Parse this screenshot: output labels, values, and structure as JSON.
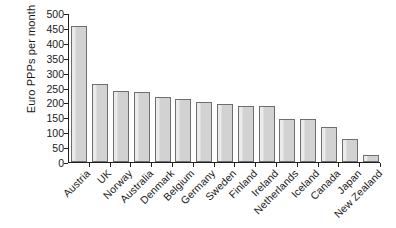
{
  "chart_data": {
    "type": "bar",
    "title": "",
    "subtitle": "",
    "xlabel": "",
    "ylabel": "Euro PPPs per month",
    "ylim": [
      0,
      500
    ],
    "ytick_step": 50,
    "yticks": [
      "500",
      "450",
      "400",
      "350",
      "300",
      "250",
      "200",
      "150",
      "100",
      "50",
      "0"
    ],
    "grid": false,
    "legend": "none",
    "axis_style": "left-and-bottom-spines",
    "xtick_label_rotation": -45,
    "categories": [
      "Austria",
      "UK",
      "Norway",
      "Australia",
      "Denmark",
      "Belgium",
      "Germany",
      "Sweden",
      "Finland",
      "Ireland",
      "Netherlands",
      "Iceland",
      "Canada",
      "Japan",
      "New Zealand"
    ],
    "values": [
      455,
      263,
      238,
      235,
      219,
      213,
      203,
      194,
      187,
      188,
      145,
      143,
      119,
      78,
      22
    ],
    "series": [
      {
        "name": "Euro PPPs per month",
        "values": [
          455,
          263,
          238,
          235,
          219,
          213,
          203,
          194,
          187,
          188,
          145,
          143,
          119,
          78,
          22
        ]
      }
    ],
    "colors": {
      "bar_fill": "#d2d2d2",
      "bar_border": "#6e6e6e",
      "axis": "#202020",
      "text": "#1a1a1a",
      "background": "#ffffff"
    }
  }
}
